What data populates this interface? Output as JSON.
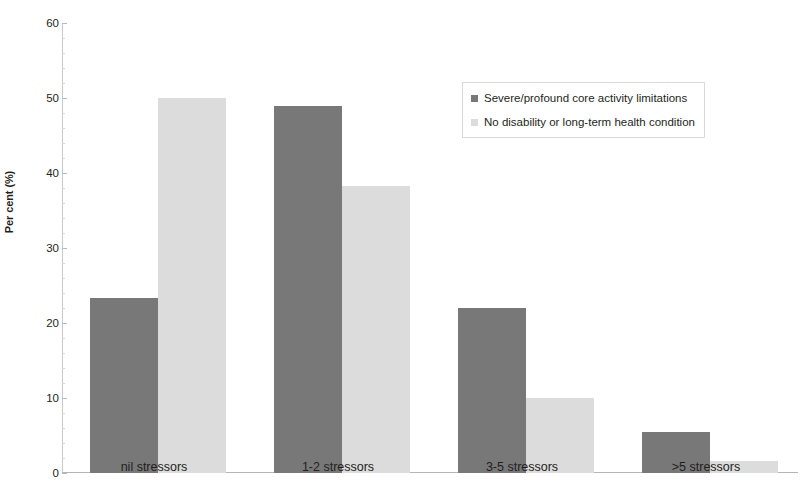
{
  "chart_data": {
    "type": "bar",
    "title": "",
    "subtitle": "",
    "xlabel": "",
    "ylabel": "Per cent (%)",
    "ylim": [
      0,
      60
    ],
    "ytick_step": 10,
    "yticks": [
      "0",
      "10",
      "20",
      "30",
      "40",
      "50",
      "60"
    ],
    "grid": false,
    "legend_position": "inside-top-right",
    "categories": [
      "nil stressors",
      "1-2 stressors",
      "3-5 stressors",
      ">5 stressors"
    ],
    "series": [
      {
        "name": "Severe/profound core activity limitations",
        "color": "#787878",
        "values": [
          23.4,
          49.0,
          22.0,
          5.5
        ]
      },
      {
        "name": "No disability or long-term health condition",
        "color": "#dcdcdc",
        "values": [
          50.0,
          38.3,
          10.0,
          1.6
        ]
      }
    ]
  },
  "colors": {
    "series_dark": "#787878",
    "series_light": "#dcdcdc",
    "axis": "#b9b9b9",
    "text": "#231f20",
    "legend_border": "#d9d9d9",
    "background": "#ffffff"
  }
}
